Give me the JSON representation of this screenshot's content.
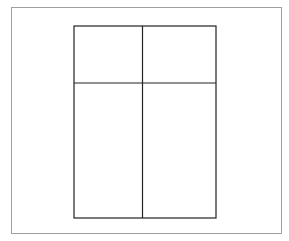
{
  "diagram": {
    "type": "window-grid",
    "frame": {
      "x": 11,
      "y": 7,
      "width": 271,
      "height": 227,
      "stroke": "#a0a0a0"
    },
    "rect": {
      "x": 74,
      "y": 26,
      "width": 142,
      "height": 192,
      "stroke": "#222222",
      "stroke_width": 1.2
    },
    "dividers": {
      "vertical_x": 142.5,
      "horizontal_y": 83
    },
    "panes": [
      {
        "id": "top-left"
      },
      {
        "id": "top-right"
      },
      {
        "id": "bottom-left"
      },
      {
        "id": "bottom-right"
      }
    ]
  }
}
